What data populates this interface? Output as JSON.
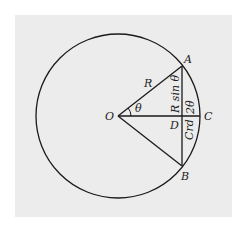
{
  "diagram": {
    "type": "geometry-chord",
    "background": "#ececec",
    "stroke": "#1a1a1a",
    "circle": {
      "cx": 118,
      "cy": 116,
      "r": 82
    },
    "points": {
      "O": {
        "label": "O",
        "x": 118,
        "y": 116
      },
      "A": {
        "label": "A",
        "x": 182,
        "y": 66
      },
      "B": {
        "label": "B",
        "x": 182,
        "y": 166
      },
      "C": {
        "label": "C",
        "x": 200,
        "y": 116
      },
      "D": {
        "label": "D",
        "x": 182,
        "y": 116
      }
    },
    "labels": {
      "R": "R",
      "theta": "θ",
      "Rsin": "R sin θ",
      "two_theta": "2θ",
      "crd": "Crd"
    }
  }
}
